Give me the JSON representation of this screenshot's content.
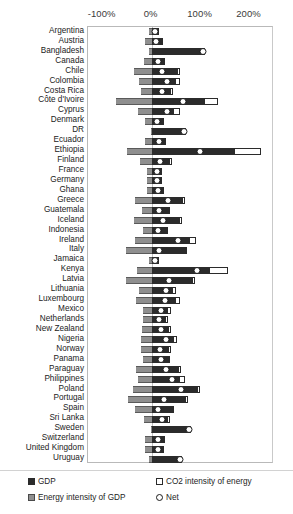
{
  "chart_data": {
    "type": "bar",
    "title": "",
    "subtitle": "",
    "xlabel": "",
    "ylabel": "",
    "orientation": "horizontal",
    "stacked": true,
    "xlim": [
      -130,
      250
    ],
    "grid": false,
    "legend_position": "bottom",
    "tick_labels": [
      "-100%",
      "0%",
      "100%",
      "200%"
    ],
    "tick_values": [
      -100,
      0,
      100,
      200
    ],
    "series": [
      {
        "name": "GDP",
        "key": "gdp",
        "color": "#2b2b2b"
      },
      {
        "name": "Energy intensity of GDP",
        "key": "energy_intensity",
        "color": "#8f8f8f"
      },
      {
        "name": "CO2 intensity of energy",
        "key": "co2_intensity",
        "color": "#ffffff"
      },
      {
        "name": "Net",
        "key": "net",
        "color": "#ffffff",
        "marker": "diamond"
      }
    ],
    "categories": [
      "Argentina",
      "Austria",
      "Bangladesh",
      "Canada",
      "Chile",
      "Colombia",
      "Costa Rica",
      "Côte d'Ivoire",
      "Cyprus",
      "Denmark",
      "DR",
      "Ecuador",
      "Ethiopia",
      "Finland",
      "France",
      "Germany",
      "Ghana",
      "Greece",
      "Guatemala",
      "Iceland",
      "Indonesia",
      "Ireland",
      "Italy",
      "Jamaica",
      "Kenya",
      "Latvia",
      "Lithuania",
      "Luxembourg",
      "Mexico",
      "Netherlands",
      "New Zealand",
      "Nigeria",
      "Norway",
      "Panama",
      "Paraguay",
      "Philippines",
      "Poland",
      "Portugal",
      "Spain",
      "Sri Lanka",
      "Sweden",
      "Switzerland",
      "United Kingdom",
      "Uruguay"
    ],
    "rows": [
      {
        "category": "Argentina",
        "energy_intensity": -6,
        "gdp": 10,
        "co2_intensity": 2,
        "net": 6
      },
      {
        "category": "Austria",
        "energy_intensity": -14,
        "gdp": 20,
        "co2_intensity": 3,
        "net": 9
      },
      {
        "category": "Bangladesh",
        "energy_intensity": -5,
        "gdp": 103,
        "co2_intensity": 6,
        "net": 104
      },
      {
        "category": "Canada",
        "energy_intensity": -16,
        "gdp": 24,
        "co2_intensity": 4,
        "net": 12
      },
      {
        "category": "Chile",
        "energy_intensity": -36,
        "gdp": 52,
        "co2_intensity": 5,
        "net": 21
      },
      {
        "category": "Colombia",
        "energy_intensity": -25,
        "gdp": 48,
        "co2_intensity": 9,
        "net": 32
      },
      {
        "category": "Costa Rica",
        "energy_intensity": -22,
        "gdp": 38,
        "co2_intensity": 6,
        "net": 22
      },
      {
        "category": "Côte d'Ivoire",
        "energy_intensity": -72,
        "gdp": 106,
        "co2_intensity": 30,
        "net": 64
      },
      {
        "category": "Cyprus",
        "energy_intensity": -27,
        "gdp": 44,
        "co2_intensity": 14,
        "net": 31
      },
      {
        "category": "Denmark",
        "energy_intensity": -14,
        "gdp": 22,
        "co2_intensity": 4,
        "net": 11
      },
      {
        "category": "DR",
        "energy_intensity": -1,
        "gdp": 66,
        "co2_intensity": 2,
        "net": 67
      },
      {
        "category": "Ecuador",
        "energy_intensity": -13,
        "gdp": 25,
        "co2_intensity": 3,
        "net": 15
      },
      {
        "category": "Ethiopia",
        "energy_intensity": -51,
        "gdp": 168,
        "co2_intensity": 55,
        "net": 98
      },
      {
        "category": "Finland",
        "energy_intensity": -24,
        "gdp": 36,
        "co2_intensity": 5,
        "net": 17
      },
      {
        "category": "France",
        "energy_intensity": -9,
        "gdp": 17,
        "co2_intensity": 3,
        "net": 11
      },
      {
        "category": "Germany",
        "energy_intensity": -9,
        "gdp": 17,
        "co2_intensity": 3,
        "net": 11
      },
      {
        "category": "Ghana",
        "energy_intensity": -10,
        "gdp": 22,
        "co2_intensity": 3,
        "net": 13
      },
      {
        "category": "Greece",
        "energy_intensity": -34,
        "gdp": 62,
        "co2_intensity": 6,
        "net": 33
      },
      {
        "category": "Guatemala",
        "energy_intensity": -19,
        "gdp": 33,
        "co2_intensity": 5,
        "net": 16
      },
      {
        "category": "Iceland",
        "energy_intensity": -36,
        "gdp": 56,
        "co2_intensity": 6,
        "net": 24
      },
      {
        "category": "Indonesia",
        "energy_intensity": -18,
        "gdp": 29,
        "co2_intensity": 4,
        "net": 13
      },
      {
        "category": "Ireland",
        "energy_intensity": -35,
        "gdp": 76,
        "co2_intensity": 14,
        "net": 54
      },
      {
        "category": "Italy",
        "energy_intensity": -53,
        "gdp": 68,
        "co2_intensity": 2,
        "net": 15
      },
      {
        "category": "Jamaica",
        "energy_intensity": -5,
        "gdp": 10,
        "co2_intensity": 2,
        "net": 6
      },
      {
        "category": "Kenya",
        "energy_intensity": -30,
        "gdp": 118,
        "co2_intensity": 38,
        "net": 92
      },
      {
        "category": "Latvia",
        "energy_intensity": -53,
        "gdp": 83,
        "co2_intensity": 6,
        "net": 36
      },
      {
        "category": "Lithuania",
        "energy_intensity": -26,
        "gdp": 42,
        "co2_intensity": 8,
        "net": 29
      },
      {
        "category": "Luxembourg",
        "energy_intensity": -31,
        "gdp": 47,
        "co2_intensity": 10,
        "net": 27
      },
      {
        "category": "Mexico",
        "energy_intensity": -18,
        "gdp": 31,
        "co2_intensity": 8,
        "net": 20
      },
      {
        "category": "Netherlands",
        "energy_intensity": -18,
        "gdp": 28,
        "co2_intensity": 5,
        "net": 15
      },
      {
        "category": "New Zealand",
        "energy_intensity": -19,
        "gdp": 33,
        "co2_intensity": 6,
        "net": 20
      },
      {
        "category": "Nigeria",
        "energy_intensity": -22,
        "gdp": 43,
        "co2_intensity": 8,
        "net": 29
      },
      {
        "category": "Norway",
        "energy_intensity": -21,
        "gdp": 34,
        "co2_intensity": 5,
        "net": 18
      },
      {
        "category": "Panama",
        "energy_intensity": -18,
        "gdp": 33,
        "co2_intensity": 4,
        "net": 19
      },
      {
        "category": "Paraguay",
        "energy_intensity": -32,
        "gdp": 54,
        "co2_intensity": 7,
        "net": 29
      },
      {
        "category": "Philippines",
        "energy_intensity": -28,
        "gdp": 56,
        "co2_intensity": 13,
        "net": 41
      },
      {
        "category": "Poland",
        "energy_intensity": -39,
        "gdp": 93,
        "co2_intensity": 6,
        "net": 60
      },
      {
        "category": "Portugal",
        "energy_intensity": -49,
        "gdp": 69,
        "co2_intensity": 6,
        "net": 26
      },
      {
        "category": "Spain",
        "energy_intensity": -34,
        "gdp": 42,
        "co2_intensity": 4,
        "net": 12
      },
      {
        "category": "Sri Lanka",
        "energy_intensity": -16,
        "gdp": 31,
        "co2_intensity": 6,
        "net": 21
      },
      {
        "category": "Sweden",
        "energy_intensity": -2,
        "gdp": 76,
        "co2_intensity": 3,
        "net": 77
      },
      {
        "category": "Switzerland",
        "energy_intensity": -13,
        "gdp": 23,
        "co2_intensity": 3,
        "net": 13
      },
      {
        "category": "United Kingdom",
        "energy_intensity": -14,
        "gdp": 22,
        "co2_intensity": 4,
        "net": 12
      },
      {
        "category": "Uruguay",
        "energy_intensity": -6,
        "gdp": 58,
        "co2_intensity": 5,
        "net": 57
      }
    ]
  },
  "legend": {
    "gdp_label": "GDP",
    "co2_label": "CO2 intensity of energy",
    "energy_label": "Energy intensity of GDP",
    "net_label": "Net"
  }
}
